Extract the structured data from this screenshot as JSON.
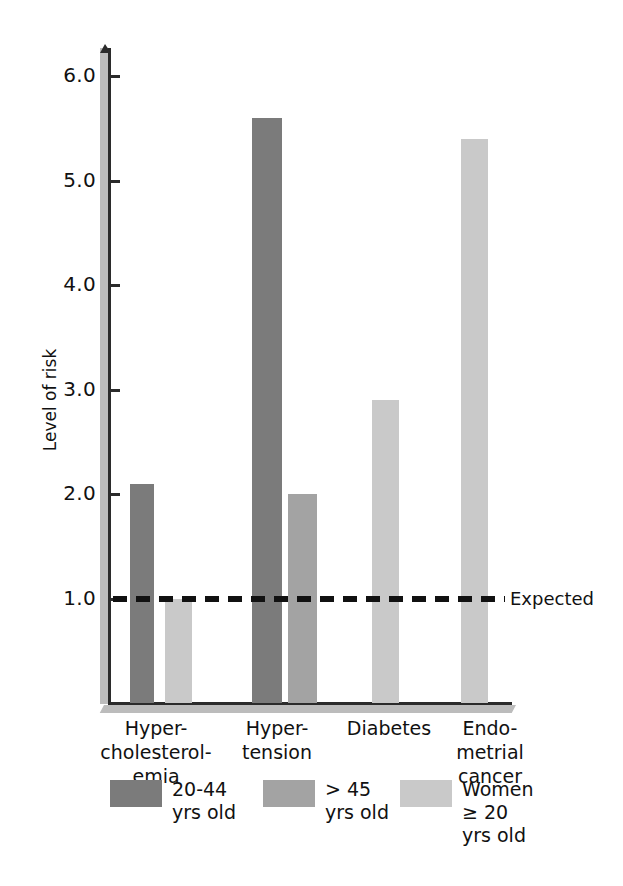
{
  "chart_data": {
    "type": "bar",
    "title": "",
    "xlabel": "",
    "ylabel": "Level of risk",
    "ylim": [
      0,
      6.3
    ],
    "grid": false,
    "legend_position": "bottom",
    "y_ticks": [
      "1.0",
      "2.0",
      "3.0",
      "4.0",
      "5.0",
      "6.0"
    ],
    "y_tick_values": [
      1.0,
      2.0,
      3.0,
      4.0,
      5.0,
      6.0
    ],
    "categories": [
      "Hyper-\ncholesterol-\nemia",
      "Hyper-\ntension",
      "Diabetes",
      "Endo-\nmetrial\ncancer"
    ],
    "series": [
      {
        "name": "20-44\nyrs old",
        "color": "#7b7b7b",
        "values": [
          2.1,
          5.6,
          null,
          null
        ]
      },
      {
        "name": "> 45\nyrs old",
        "color": "#a3a3a3",
        "values": [
          null,
          2.0,
          null,
          null
        ]
      },
      {
        "name": "Women\n≥ 20\nyrs old",
        "color": "#c9c9c9",
        "values": [
          1.0,
          null,
          2.9,
          5.4
        ]
      }
    ],
    "annotations": [
      {
        "label": "Expected",
        "value": 1.0,
        "style": "dashed-horizontal-line",
        "color": "#111111"
      }
    ]
  },
  "bars": [
    {
      "name": "hypercholesterolemia-20-44",
      "value": 2.1,
      "x": 130,
      "width": 24,
      "color": "#7b7b7b"
    },
    {
      "name": "hypercholesterolemia-women-20",
      "value": 1.0,
      "x": 165,
      "width": 27,
      "color": "#c9c9c9"
    },
    {
      "name": "hypertension-20-44",
      "value": 5.6,
      "x": 252,
      "width": 30,
      "color": "#7b7b7b"
    },
    {
      "name": "hypertension-over-45",
      "value": 2.0,
      "x": 288,
      "width": 29,
      "color": "#a3a3a3"
    },
    {
      "name": "diabetes-women-20",
      "value": 2.9,
      "x": 372,
      "width": 27,
      "color": "#c9c9c9"
    },
    {
      "name": "endometrial-cancer-women-20",
      "value": 5.4,
      "x": 461,
      "width": 27,
      "color": "#c9c9c9"
    }
  ],
  "category_positions": [
    {
      "left": 96,
      "width": 120
    },
    {
      "left": 222,
      "width": 110
    },
    {
      "left": 334,
      "width": 110
    },
    {
      "left": 440,
      "width": 100
    }
  ],
  "legend": {
    "items": [
      {
        "label": "20-44\nyrs old",
        "color": "#7b7b7b",
        "left": 110
      },
      {
        "label": "> 45\nyrs old",
        "color": "#a3a3a3",
        "left": 263
      },
      {
        "label": "Women\n≥ 20\nyrs old",
        "color": "#c9c9c9",
        "left": 400
      }
    ]
  },
  "expected": {
    "label": "Expected",
    "value": "1.0",
    "line_left": 113,
    "line_width": 392,
    "label_left": 510
  },
  "geometry": {
    "baseline_y": 703,
    "px_per_unit": 104.5,
    "axis_x": 108
  }
}
